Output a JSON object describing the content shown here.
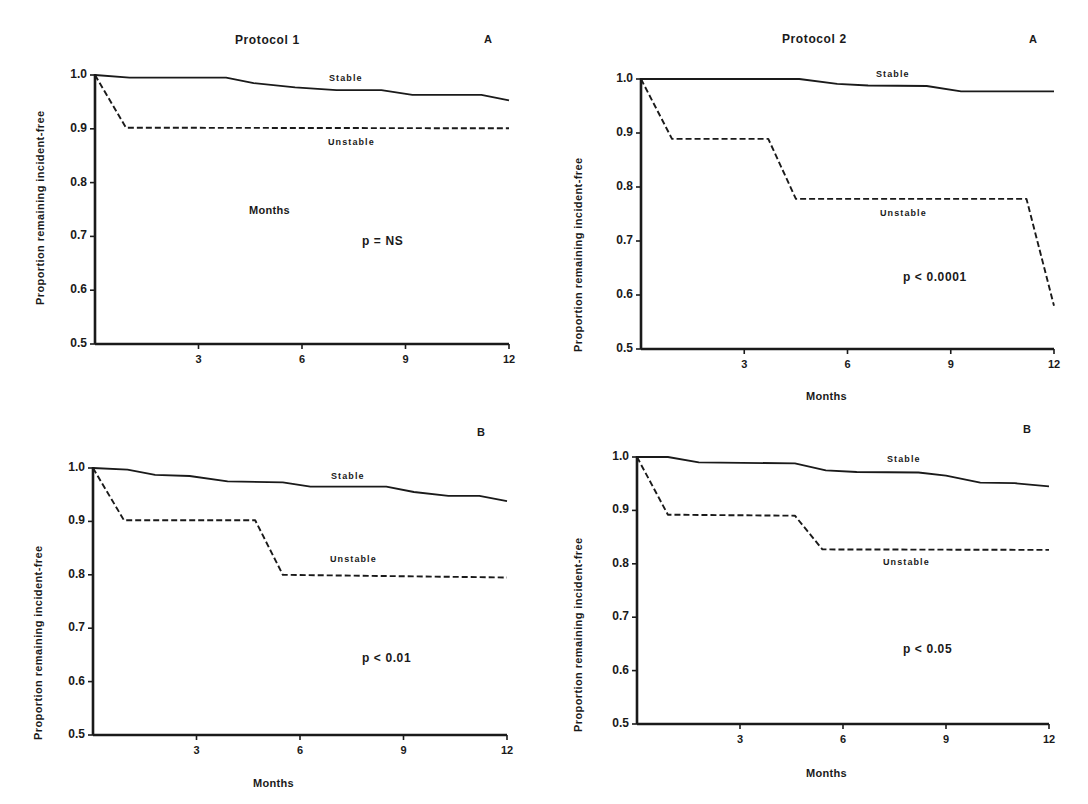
{
  "page_fragment": {
    "top_text": "y"
  },
  "chart_data": [
    {
      "id": "p1a",
      "type": "line",
      "title": "Protocol 1",
      "corner_label": "A",
      "xlabel": "Months",
      "ylabel": "Proportion remaining incident-free",
      "xlim": [
        0,
        12
      ],
      "ylim": [
        0.5,
        1.0
      ],
      "x_ticks": [
        3,
        6,
        9,
        12
      ],
      "x_tick_labels": [
        "3",
        "6",
        "9",
        "12"
      ],
      "y_ticks": [
        0.5,
        0.6,
        0.7,
        0.8,
        0.9,
        1.0
      ],
      "y_tick_labels": [
        "0.5",
        "0.6",
        "0.7",
        "0.8",
        "0.9",
        "1.0"
      ],
      "grid": false,
      "annotation": "p = NS",
      "series": [
        {
          "name": "Stable",
          "style": "solid",
          "x": [
            0,
            1,
            3.8,
            4.6,
            5.8,
            7,
            8.3,
            9.2,
            11.2,
            12
          ],
          "y": [
            1.0,
            0.995,
            0.995,
            0.985,
            0.977,
            0.972,
            0.972,
            0.963,
            0.963,
            0.953
          ]
        },
        {
          "name": "Unstable",
          "style": "dashed",
          "x": [
            0,
            0.9,
            12
          ],
          "y": [
            1.0,
            0.902,
            0.901
          ]
        }
      ]
    },
    {
      "id": "p2a",
      "type": "line",
      "title": "Protocol 2",
      "corner_label": "A",
      "xlabel": "Months",
      "ylabel": "Proportion remaining incident-free",
      "xlim": [
        0,
        12
      ],
      "ylim": [
        0.5,
        1.0
      ],
      "x_ticks": [
        3,
        6,
        9,
        12
      ],
      "x_tick_labels": [
        "3",
        "6",
        "9",
        "12"
      ],
      "y_ticks": [
        0.5,
        0.6,
        0.7,
        0.8,
        0.9,
        1.0
      ],
      "y_tick_labels": [
        "0.5",
        "0.6",
        "0.7",
        "0.8",
        "0.9",
        "1.0"
      ],
      "grid": false,
      "annotation": "p < 0.0001",
      "series": [
        {
          "name": "Stable",
          "style": "solid",
          "x": [
            0,
            4.6,
            5.7,
            6.6,
            8.3,
            9.3,
            12
          ],
          "y": [
            1.0,
            1.0,
            0.991,
            0.988,
            0.987,
            0.977,
            0.977
          ]
        },
        {
          "name": "Unstable",
          "style": "dashed",
          "x": [
            0,
            0.9,
            3.7,
            4.5,
            11.2,
            12
          ],
          "y": [
            1.0,
            0.889,
            0.889,
            0.778,
            0.778,
            0.58
          ]
        }
      ]
    },
    {
      "id": "p1b",
      "type": "line",
      "title": "",
      "corner_label": "B",
      "xlabel": "Months",
      "ylabel": "Proportion remaining incident-free",
      "xlim": [
        0,
        12
      ],
      "ylim": [
        0.5,
        1.0
      ],
      "x_ticks": [
        3,
        6,
        9,
        12
      ],
      "x_tick_labels": [
        "3",
        "6",
        "9",
        "12"
      ],
      "y_ticks": [
        0.5,
        0.6,
        0.7,
        0.8,
        0.9,
        1.0
      ],
      "y_tick_labels": [
        "0.5",
        "0.6",
        "0.7",
        "0.8",
        "0.9",
        "1.0"
      ],
      "grid": false,
      "annotation": "p < 0.01",
      "series": [
        {
          "name": "Stable",
          "style": "solid",
          "x": [
            0,
            1,
            1.8,
            2.8,
            3.9,
            5.5,
            6.3,
            8.5,
            9.3,
            10.3,
            11.2,
            12
          ],
          "y": [
            1.0,
            0.997,
            0.987,
            0.985,
            0.975,
            0.973,
            0.965,
            0.965,
            0.955,
            0.948,
            0.948,
            0.938
          ]
        },
        {
          "name": "Unstable",
          "style": "dashed",
          "x": [
            0,
            0.9,
            4.7,
            5.5,
            12
          ],
          "y": [
            1.0,
            0.902,
            0.902,
            0.8,
            0.795
          ]
        }
      ]
    },
    {
      "id": "p2b",
      "type": "line",
      "title": "",
      "corner_label": "B",
      "xlabel": "Months",
      "ylabel": "Proportion remaining incident-free",
      "xlim": [
        0,
        12
      ],
      "ylim": [
        0.5,
        1.0
      ],
      "x_ticks": [
        3,
        6,
        9,
        12
      ],
      "x_tick_labels": [
        "3",
        "6",
        "9",
        "12"
      ],
      "y_ticks": [
        0.5,
        0.6,
        0.7,
        0.8,
        0.9,
        1.0
      ],
      "y_tick_labels": [
        "0.5",
        "0.6",
        "0.7",
        "0.8",
        "0.9",
        "1.0"
      ],
      "grid": false,
      "annotation": "p < 0.05",
      "series": [
        {
          "name": "Stable",
          "style": "solid",
          "x": [
            0,
            0.9,
            1.8,
            4.6,
            5.5,
            6.4,
            8.2,
            9,
            10,
            11,
            12
          ],
          "y": [
            1.0,
            1.0,
            0.99,
            0.988,
            0.975,
            0.972,
            0.971,
            0.965,
            0.952,
            0.951,
            0.945
          ]
        },
        {
          "name": "Unstable",
          "style": "dashed",
          "x": [
            0,
            0.9,
            4.6,
            5.4,
            12
          ],
          "y": [
            1.0,
            0.892,
            0.89,
            0.827,
            0.826
          ]
        }
      ]
    }
  ],
  "colors": {
    "ink": "#1a1a1a",
    "background": "#ffffff"
  }
}
